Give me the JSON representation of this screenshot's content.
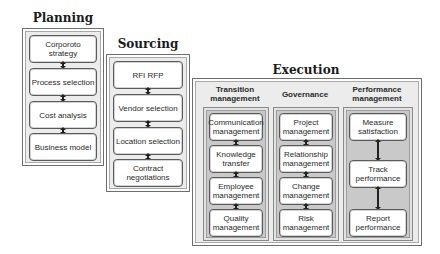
{
  "phases": {
    "planning": {
      "title": "Planning",
      "steps": [
        "Corporoto strategy",
        "Process selection",
        "Cost analysis",
        "Business model"
      ]
    },
    "sourcing": {
      "title": "Sourcing",
      "steps": [
        "RFI RFP",
        "Vendor selection",
        "Location selection",
        "Contract negotiations"
      ]
    },
    "execution": {
      "title": "Execution",
      "columns": [
        {
          "heading": "Transition management",
          "steps": [
            "Communication management",
            "Knowledge transfer",
            "Employee management",
            "Quality management"
          ]
        },
        {
          "heading": "Governance",
          "steps": [
            "Project management",
            "Relationship management",
            "Change management",
            "Risk management"
          ]
        },
        {
          "heading": "Performance management",
          "steps": [
            "Measure satisfaction",
            "Track performance",
            "Report performance"
          ]
        }
      ]
    }
  },
  "colors": {
    "outer_panel": "#ececec",
    "inner_panel": "#c9c9c9",
    "step_box": "#ffffff",
    "border": "#5a5a5a",
    "arrow": "#222222"
  }
}
